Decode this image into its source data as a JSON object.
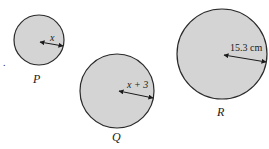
{
  "diagram": {
    "type": "circles",
    "fill_color": "#d4d4d4",
    "stroke_color": "#2a2a2a",
    "stray_mark": ".",
    "circles": [
      {
        "name": "P",
        "radius_label": "x"
      },
      {
        "name": "Q",
        "radius_label": "x + 3"
      },
      {
        "name": "R",
        "radius_label": "15.3 cm"
      }
    ]
  }
}
